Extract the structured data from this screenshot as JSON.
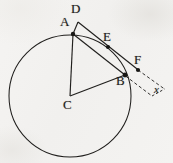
{
  "figure": {
    "kind": "circle-geometry-diagram",
    "background_color": "#f3f2f0",
    "ink_color": "#201f1d",
    "canvas": {
      "width": 173,
      "height": 163
    }
  },
  "circle": {
    "name": "main-circle",
    "center_label": "C",
    "center": {
      "x": 70,
      "y": 96
    },
    "radius": 61,
    "stroke_width": 1.1
  },
  "points": [
    {
      "id": "A",
      "label": "A",
      "x": 73,
      "y": 34,
      "label_x": 62,
      "label_y": 20,
      "dot": true
    },
    {
      "id": "B",
      "label": "B",
      "x": 125,
      "y": 75,
      "label_x": 118,
      "label_y": 79,
      "dot": true
    },
    {
      "id": "C",
      "label": "C",
      "x": 70,
      "y": 96,
      "label_x": 64,
      "label_y": 98,
      "dot": false
    },
    {
      "id": "D",
      "label": "D",
      "x": 78,
      "y": 22,
      "label_x": 72,
      "label_y": 6,
      "dot": false
    },
    {
      "id": "E",
      "label": "E",
      "x": 108,
      "y": 47,
      "label_x": 104,
      "label_y": 33,
      "dot": true
    },
    {
      "id": "F",
      "label": "F",
      "x": 138,
      "y": 70,
      "label_x": 135,
      "label_y": 56,
      "dot": true
    }
  ],
  "segments": [
    {
      "id": "DA",
      "name": "segment-D-A",
      "from": "D",
      "to": "A",
      "style": "solid"
    },
    {
      "id": "DF",
      "name": "segment-D-through-E-to-F",
      "from": "D",
      "to": "F",
      "style": "solid"
    },
    {
      "id": "AB",
      "name": "chord-A-B",
      "from": "A",
      "to": "B",
      "style": "solid"
    },
    {
      "id": "CA",
      "name": "radius-C-A",
      "from": "C",
      "to": "A",
      "style": "solid"
    },
    {
      "id": "CB",
      "name": "radius-C-B",
      "from": "C",
      "to": "B",
      "style": "solid"
    }
  ],
  "dashed_marker": {
    "name": "x-length-marker",
    "label": "x",
    "label_x": 154,
    "label_y": 86,
    "from_upper": {
      "x": 138,
      "y": 70
    },
    "to_upper": {
      "x": 164,
      "y": 89
    },
    "from_lower": {
      "x": 125,
      "y": 76
    },
    "to_lower": {
      "x": 152,
      "y": 96
    },
    "cap_from": {
      "x": 152,
      "y": 96
    },
    "cap_to": {
      "x": 164,
      "y": 89
    },
    "style": "dashed"
  }
}
